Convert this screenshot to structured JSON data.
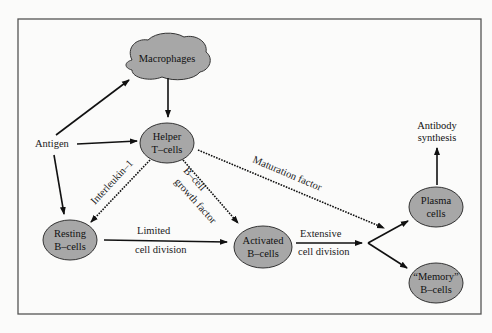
{
  "caption": "",
  "nodes": {
    "macrophages": {
      "label": "Macrophages"
    },
    "antigen": {
      "label": "Antigen"
    },
    "helper_t": {
      "line1": "Helper",
      "line2": "T–cells"
    },
    "resting_b": {
      "line1": "Resting",
      "line2": "B–cells"
    },
    "activated_b": {
      "line1": "Activated",
      "line2": "B–cells"
    },
    "plasma": {
      "line1": "Plasma",
      "line2": "cells"
    },
    "memory_b": {
      "line1": "“Memory”",
      "line2": "B–cells"
    },
    "antibody": {
      "line1": "Antibody",
      "line2": "synthesis"
    }
  },
  "edges": {
    "interleukin": "Interleukin–1",
    "bcell_growth_1": "B–cell",
    "bcell_growth_2": "growth factor",
    "maturation": "Maturation factor",
    "limited_1": "Limited",
    "limited_2": "cell division",
    "extensive_1": "Extensive",
    "extensive_2": "cell division"
  },
  "colors": {
    "cell_fill": "#a7a7a7",
    "line": "#111111",
    "background": "#fbfbfa"
  }
}
